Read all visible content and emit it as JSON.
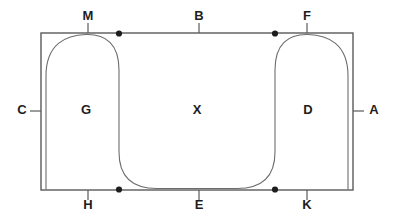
{
  "figure": {
    "canvas": {
      "width": 394,
      "height": 223
    },
    "colors": {
      "background": "#ffffff",
      "outline": "#5a5a5a",
      "curve": "#6d6d6d",
      "label": "#1d1d1d",
      "vertex": "#1d1d1d"
    },
    "rect": {
      "x": 41,
      "y": 33,
      "width": 312,
      "height": 157
    },
    "edge_labels": [
      {
        "id": "M",
        "text": "M",
        "x": 88,
        "y": 17,
        "tick": {
          "x1": 88,
          "y1": 23,
          "x2": 88,
          "y2": 33
        },
        "edge": "top"
      },
      {
        "id": "B",
        "text": "B",
        "x": 199,
        "y": 17,
        "tick": {
          "x1": 199,
          "y1": 23,
          "x2": 199,
          "y2": 33
        },
        "edge": "top"
      },
      {
        "id": "F",
        "text": "F",
        "x": 307,
        "y": 17,
        "tick": {
          "x1": 307,
          "y1": 23,
          "x2": 307,
          "y2": 33
        },
        "edge": "top"
      },
      {
        "id": "C",
        "text": "C",
        "x": 22,
        "y": 111,
        "tick": {
          "x1": 30,
          "y1": 111,
          "x2": 41,
          "y2": 111
        },
        "edge": "left"
      },
      {
        "id": "A",
        "text": "A",
        "x": 374,
        "y": 111,
        "tick": {
          "x1": 353,
          "y1": 111,
          "x2": 364,
          "y2": 111
        },
        "edge": "right"
      },
      {
        "id": "H",
        "text": "H",
        "x": 88,
        "y": 206,
        "tick": {
          "x1": 88,
          "y1": 190,
          "x2": 88,
          "y2": 200
        },
        "edge": "bottom"
      },
      {
        "id": "E",
        "text": "E",
        "x": 199,
        "y": 206,
        "tick": {
          "x1": 199,
          "y1": 190,
          "x2": 199,
          "y2": 200
        },
        "edge": "bottom"
      },
      {
        "id": "K",
        "text": "K",
        "x": 307,
        "y": 206,
        "tick": {
          "x1": 307,
          "y1": 190,
          "x2": 307,
          "y2": 200
        },
        "edge": "bottom"
      }
    ],
    "region_labels": [
      {
        "id": "G",
        "text": "G",
        "x": 86,
        "y": 111
      },
      {
        "id": "X",
        "text": "X",
        "x": 197,
        "y": 111
      },
      {
        "id": "D",
        "text": "D",
        "x": 308,
        "y": 111
      }
    ],
    "vertex_dots": [
      {
        "id": "top-left-dot",
        "x": 119,
        "y": 33.5,
        "r": 3.1
      },
      {
        "id": "top-right-dot",
        "x": 275,
        "y": 33.5,
        "r": 3.1
      },
      {
        "id": "bottom-left-dot",
        "x": 119,
        "y": 189.5,
        "r": 3.1
      },
      {
        "id": "bottom-right-dot",
        "x": 275,
        "y": 189.5,
        "r": 3.1
      }
    ],
    "curve_path": "M 46 189 L 46 76 C 46 44 66 35 86 34.5 C 106 34 119 44 119 70 L 119 152 C 119 178 134 188.5 157 188.5 C 180 188.5 197 188.5 197 188.5 C 197 188.5 214 188.5 237 188.5 C 260 188.5 275 178 275 152 L 275 70 C 275 44 288 34 308 34.5 C 328 35 348 44 348 76 L 348 189",
    "curve_segments": [
      {
        "name": "left-vertical",
        "desc": "rises from bottom edge near left rectangle side"
      },
      {
        "name": "left-arch",
        "desc": "rounded arch top meeting top edge at M"
      },
      {
        "name": "left-descent",
        "desc": "falls to the central valley at dot x=119"
      },
      {
        "name": "center-valley",
        "desc": "U-shaped dip whose base sits just above the bottom edge at E"
      },
      {
        "name": "right-ascent",
        "desc": "rises from the valley to the right arch at dot x=275"
      },
      {
        "name": "right-arch",
        "desc": "rounded arch top meeting top edge at F"
      },
      {
        "name": "right-vertical",
        "desc": "descends to bottom edge near right rectangle side"
      }
    ]
  }
}
